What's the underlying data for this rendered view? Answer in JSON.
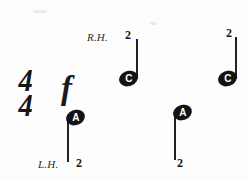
{
  "page": {
    "kind": "music-notation-excerpt",
    "background_color": "#fdfdfd",
    "ink_color": "#131317",
    "width": 249,
    "height": 181
  },
  "time_signature": {
    "numerator": "4",
    "denominator": "4",
    "display": "4/4"
  },
  "dynamic": {
    "symbol": "f",
    "meaning": "forte"
  },
  "hand_labels": [
    {
      "text": "R.H.",
      "meaning": "right hand",
      "x": 87,
      "y": 31
    },
    {
      "text": "L.H.",
      "meaning": "left hand",
      "x": 38,
      "y": 158
    }
  ],
  "notes": [
    {
      "id": "note-1",
      "pitch_letter": "A",
      "fingering": "2",
      "hand": "L.H.",
      "stem_direction": "down",
      "head_x": 66,
      "head_y": 110,
      "stem_x": 67,
      "stem_y": 118,
      "stem_height": 44,
      "finger_x": 76,
      "finger_y": 157
    },
    {
      "id": "note-2",
      "pitch_letter": "C",
      "fingering": "2",
      "hand": "R.H.",
      "stem_direction": "up",
      "head_x": 119,
      "head_y": 71,
      "stem_x": 136,
      "stem_y": 39,
      "stem_height": 40,
      "finger_x": 125,
      "finger_y": 29
    },
    {
      "id": "note-3",
      "pitch_letter": "A",
      "fingering": "2",
      "hand": "L.H.",
      "stem_direction": "down",
      "head_x": 173,
      "head_y": 105,
      "stem_x": 174,
      "stem_y": 113,
      "stem_height": 47,
      "finger_x": 177,
      "finger_y": 157
    },
    {
      "id": "note-4",
      "pitch_letter": "C",
      "fingering": "2",
      "hand": "R.H.",
      "stem_direction": "up",
      "head_x": 218,
      "head_y": 71,
      "stem_x": 235,
      "stem_y": 37,
      "stem_height": 42,
      "finger_x": 226,
      "finger_y": 27
    }
  ]
}
